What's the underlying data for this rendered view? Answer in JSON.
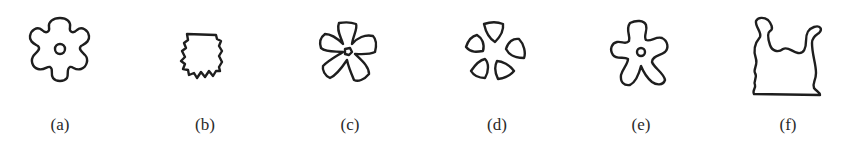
{
  "figure": {
    "background": "#ffffff",
    "stroke_color": "#1e1e1e",
    "panels": [
      {
        "id": "a",
        "label": "(a)",
        "shape": "six-lobed rounded rosette with central hole",
        "label_center_x": 60
      },
      {
        "id": "b",
        "label": "(b)",
        "shape": "jagged serrated scallop silhouette",
        "label_center_x": 205
      },
      {
        "id": "c",
        "label": "(c)",
        "shape": "five-petal flower with small central hole",
        "label_center_x": 350
      },
      {
        "id": "d",
        "label": "(d)",
        "shape": "five separated rounded-triangle petals around empty center",
        "label_center_x": 497
      },
      {
        "id": "e",
        "label": "(e)",
        "shape": "five-armed wavy star with central hole",
        "label_center_x": 641
      },
      {
        "id": "f",
        "label": "(f)",
        "shape": "U-shaped vessel silhouette with curled horns and flat base",
        "label_center_x": 788
      }
    ]
  }
}
